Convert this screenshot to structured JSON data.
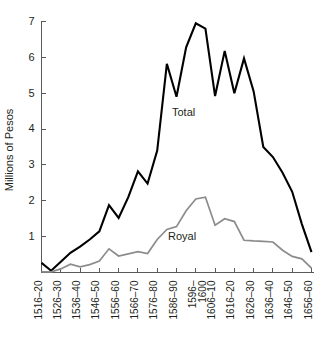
{
  "chart_data": {
    "type": "line",
    "title": "",
    "xlabel": "",
    "ylabel": "Millions of Pesos",
    "ylim": [
      0,
      7.4
    ],
    "yticks": [
      1,
      2,
      3,
      4,
      5,
      6,
      7
    ],
    "ytick_labels": [
      "1",
      "2",
      "3",
      "4",
      "5",
      "6",
      "7"
    ],
    "grid": false,
    "legend_position": "inline-annotations",
    "categories": [
      "1516–20",
      "1521–25",
      "1526–30",
      "1531–35",
      "1536–40",
      "1541–45",
      "1546–50",
      "1551–55",
      "1556–60",
      "1561–65",
      "1566–70",
      "1571–75",
      "1576–80",
      "1581–85",
      "1586–90",
      "1591–95",
      "1596–1600",
      "1601–05",
      "1606–10",
      "1611–15",
      "1616–20",
      "1621–25",
      "1626–30",
      "1631–35",
      "1636–40",
      "1641–45",
      "1646–50",
      "1651–55",
      "1656–60"
    ],
    "xtick_labels": [
      "1516–20",
      "1526–30",
      "1536–40",
      "1546–50",
      "1556–60",
      "1566–70",
      "1576–80",
      "1586–90",
      "1596–1600",
      "1606–10",
      "1616–20",
      "1626–30",
      "1636–40",
      "1646–50",
      "1656–60"
    ],
    "xtick_indices": [
      0,
      2,
      4,
      6,
      8,
      10,
      12,
      14,
      16,
      18,
      20,
      22,
      24,
      26,
      28
    ],
    "series": [
      {
        "name": "Total",
        "color": "#000000",
        "label_text": "Total",
        "values": [
          0.27,
          0.05,
          0.3,
          0.55,
          0.72,
          0.92,
          1.15,
          1.88,
          1.52,
          2.1,
          2.82,
          2.48,
          3.4,
          5.82,
          4.9,
          6.28,
          6.95,
          6.8,
          4.92,
          6.18,
          5.0,
          5.97,
          5.05,
          3.5,
          3.22,
          2.78,
          2.25,
          1.35,
          0.57
        ]
      },
      {
        "name": "Royal",
        "color": "#8c8c8c",
        "label_text": "Royal",
        "values": [
          0.02,
          0.02,
          0.1,
          0.23,
          0.16,
          0.22,
          0.32,
          0.66,
          0.46,
          0.52,
          0.58,
          0.53,
          0.92,
          1.2,
          1.28,
          1.72,
          2.05,
          2.1,
          1.32,
          1.5,
          1.42,
          0.9,
          0.88,
          0.87,
          0.85,
          0.62,
          0.45,
          0.38,
          0.12
        ]
      }
    ]
  },
  "labels": {
    "y_axis_title": "Millions of Pesos",
    "total_annotation": "Total",
    "royal_annotation": "Royal"
  }
}
